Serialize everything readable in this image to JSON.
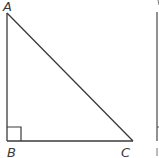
{
  "figure": {
    "type": "right-triangle",
    "stroke_color": "#3a3a3a",
    "vertices": {
      "A": {
        "label": "A",
        "x": 7,
        "y": 13
      },
      "B": {
        "label": "B",
        "x": 7,
        "y": 141
      },
      "C": {
        "label": "C",
        "x": 133,
        "y": 141
      }
    },
    "right_angle_at": "B",
    "right_angle_marker_size": 14
  },
  "partial_figure": {
    "description": "edge of adjacent figure",
    "line_x": 157,
    "top_y": 12,
    "bottom_y": 141
  }
}
